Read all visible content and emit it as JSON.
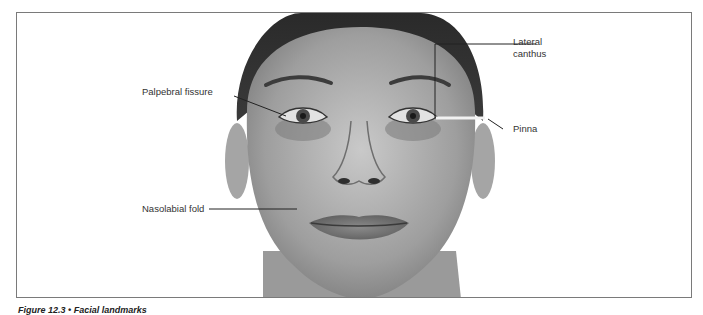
{
  "figure": {
    "labels": {
      "palpebral_fissure": "Palpebral fissure",
      "lateral_canthus_line1": "Lateral",
      "lateral_canthus_line2": "canthus",
      "pinna": "Pinna",
      "nasolabial_fold": "Nasolabial fold"
    },
    "caption": "Figure 12.3 • Facial landmarks",
    "image_subject": "front-facing portrait of a woman's face (grayscale)"
  }
}
